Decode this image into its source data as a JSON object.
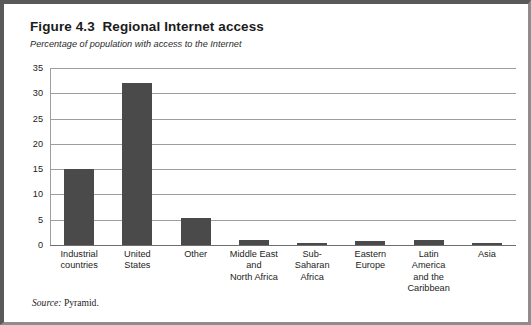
{
  "figure": {
    "title": "Figure 4.3  Regional Internet access",
    "subtitle": "Percentage of population with access to the Internet",
    "source_label": "Source:",
    "source_value": " Pyramid.",
    "border_color": "#5a5a5a",
    "background_color": "#ffffff"
  },
  "chart_data": {
    "type": "bar",
    "title": "Figure 4.3  Regional Internet access",
    "subtitle": "Percentage of population with access to the Internet",
    "xlabel": "",
    "ylabel": "",
    "ylim": [
      0,
      35
    ],
    "yticks": [
      0,
      5,
      10,
      15,
      20,
      25,
      30,
      35
    ],
    "ytick_labels": [
      "0",
      "5",
      "10",
      "15",
      "20",
      "25",
      "30",
      "35"
    ],
    "grid": true,
    "legend": false,
    "bar_color": "#4a4a4a",
    "categories": [
      "Industrial countries",
      "United States",
      "Other",
      "Middle East and North Africa",
      "Sub-Saharan Africa",
      "Eastern Europe",
      "Latin America and the Caribbean",
      "Asia"
    ],
    "category_label_lines": [
      [
        "Industrial",
        "countries"
      ],
      [
        "United",
        "States"
      ],
      [
        "Other"
      ],
      [
        "Middle East",
        "and",
        "North Africa"
      ],
      [
        "Sub-",
        "Saharan",
        "Africa"
      ],
      [
        "Eastern",
        "Europe"
      ],
      [
        "Latin",
        "America",
        "and the",
        "Caribbean"
      ],
      [
        "Asia"
      ]
    ],
    "values": [
      15,
      32,
      5.3,
      0.9,
      0.4,
      0.7,
      0.9,
      0.4
    ]
  }
}
